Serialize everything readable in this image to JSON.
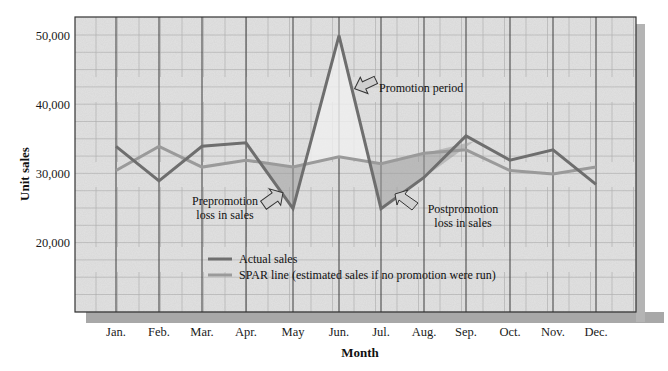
{
  "chart_data": {
    "type": "line",
    "title": "",
    "xlabel": "Month",
    "ylabel": "Unit sales",
    "categories": [
      "Jan.",
      "Feb.",
      "Mar.",
      "Apr.",
      "May",
      "Jun.",
      "Jul.",
      "Aug.",
      "Sep.",
      "Oct.",
      "Nov.",
      "Dec."
    ],
    "yticks": [
      "20,000",
      "30,000",
      "40,000",
      "50,000"
    ],
    "ytick_values": [
      20000,
      30000,
      40000,
      50000
    ],
    "ylim": [
      12000,
      52500
    ],
    "grid": true,
    "legend_position": "lower-center-inside",
    "series": [
      {
        "name": "Actual sales",
        "color": "#6e6e6e",
        "values": [
          34000,
          29000,
          34000,
          34500,
          25000,
          50000,
          25000,
          29500,
          35500,
          32000,
          33500,
          28500
        ]
      },
      {
        "name": "SPAR line (estimated sales if no promotion were run)",
        "color": "#9a9a9a",
        "values": [
          30500,
          34000,
          31000,
          32000,
          31000,
          32500,
          31500,
          33000,
          33500,
          30500,
          30000,
          31000
        ]
      }
    ],
    "shaded_regions": [
      {
        "label": "Prepromotion loss in sales",
        "from": "Apr.",
        "to": "May"
      },
      {
        "label": "Promotion period",
        "from": "May",
        "to": "Jul."
      },
      {
        "label": "Postpromotion loss in sales",
        "from": "Jul.",
        "to": "Aug."
      }
    ],
    "annotations": [
      {
        "text": "Promotion period",
        "near": "Jun."
      },
      {
        "text": "Prepromotion loss in sales",
        "lines": [
          "Prepromotion",
          "loss in sales"
        ],
        "near": "May"
      },
      {
        "text": "Postpromotion loss in sales",
        "lines": [
          "Postpromotion",
          "loss in sales"
        ],
        "near": "Aug."
      }
    ]
  },
  "labels": {
    "ylabel": "Unit sales",
    "xlabel": "Month",
    "annot_promo": "Promotion period",
    "annot_pre_1": "Prepromotion",
    "annot_pre_2": "loss in sales",
    "annot_post_1": "Postpromotion",
    "annot_post_2": "loss in sales",
    "legend_actual": "Actual sales",
    "legend_spar": "SPAR line (estimated sales if no promotion were run)"
  }
}
